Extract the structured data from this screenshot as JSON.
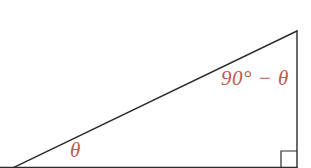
{
  "figure": {
    "type": "right-triangle-diagram",
    "background_color": "#ffffff",
    "stroke_color": "#2b2b2b",
    "label_color": "#c4564f",
    "labels": {
      "top_angle": "90° − θ",
      "bottom_left_angle": "θ"
    },
    "geometry": {
      "apex": [
        297,
        31
      ],
      "right_angle_vertex": [
        297,
        167
      ],
      "base_left_exit": [
        20,
        167
      ],
      "right_angle_marker": {
        "x": 281,
        "y": 151,
        "size": 16
      }
    },
    "icons": {
      "right_angle_marker": "right-angle-icon"
    }
  }
}
